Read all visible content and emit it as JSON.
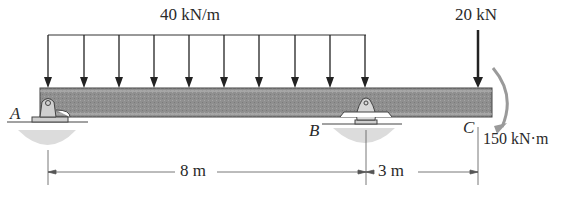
{
  "diagram": {
    "type": "beam-loading",
    "distributed_load": {
      "label": "40 kN/m",
      "from": "A",
      "to": "B"
    },
    "point_load": {
      "label": "20 kN",
      "at": "C",
      "direction": "down"
    },
    "moment": {
      "label": "150 kN·m",
      "at": "C",
      "direction": "clockwise"
    },
    "supports": [
      {
        "label": "A",
        "type": "pin"
      },
      {
        "label": "B",
        "type": "roller"
      },
      {
        "label": "C",
        "type": "free-end"
      }
    ],
    "dimensions": [
      {
        "label": "8 m",
        "from": "A",
        "to": "B"
      },
      {
        "label": "3 m",
        "from": "B",
        "to": "C"
      }
    ],
    "colors": {
      "beam": "#8a8a8a",
      "arrow": "#222222",
      "moment": "#9a9a9a",
      "ground": "#d6d6d6"
    }
  }
}
